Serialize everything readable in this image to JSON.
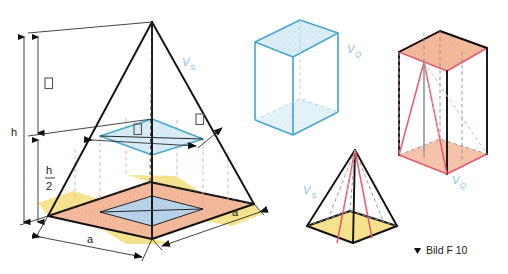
{
  "figure": {
    "caption": "Bild F 10",
    "caption_marker": "▲",
    "background_color": "#ffffff"
  },
  "colors": {
    "outline": "#111111",
    "blue_stroke": "#4aa8cf",
    "blue_fill": "#cfe6f2",
    "blue_label": "#7fc4e0",
    "red_stroke": "#e8596b",
    "salmon_fill": "#f3b99b",
    "yellow_fill": "#f6e38f",
    "grey_dash": "#8d8d8d"
  },
  "panels": [
    {
      "id": "main-pyramid",
      "name": "Square pyramid with height and base dimensions",
      "volume_label": "V",
      "volume_sub": "S",
      "base_faces": [
        "yellow corner triangles",
        "salmon middle band",
        "blue inner square"
      ]
    },
    {
      "id": "prism-blue",
      "name": "Blue transparent square prism",
      "volume_label": "V",
      "volume_sub": "Q"
    },
    {
      "id": "small-pyramid",
      "name": "Small square pyramid with yellow base",
      "volume_label": "V",
      "volume_sub": "S"
    },
    {
      "id": "prism-red",
      "name": "Prism containing inscribed red pyramid",
      "volume_label": "V",
      "volume_sub": "Q"
    }
  ],
  "dimensions": {
    "height_full": "h",
    "height_half_num": "h",
    "height_half_den": "2",
    "height_upper_glyph": "□",
    "base_edge_front": "a",
    "base_edge_right": "a",
    "mid_width_glyph": "□",
    "mid_corner_glyph": "□"
  },
  "labels": {
    "vs_main": {
      "base": "V",
      "sub": "S"
    },
    "vq_cube": {
      "base": "V",
      "sub": "Q"
    },
    "vs_small": {
      "base": "V",
      "sub": "S"
    },
    "vq_prism": {
      "base": "V",
      "sub": "Q"
    }
  }
}
